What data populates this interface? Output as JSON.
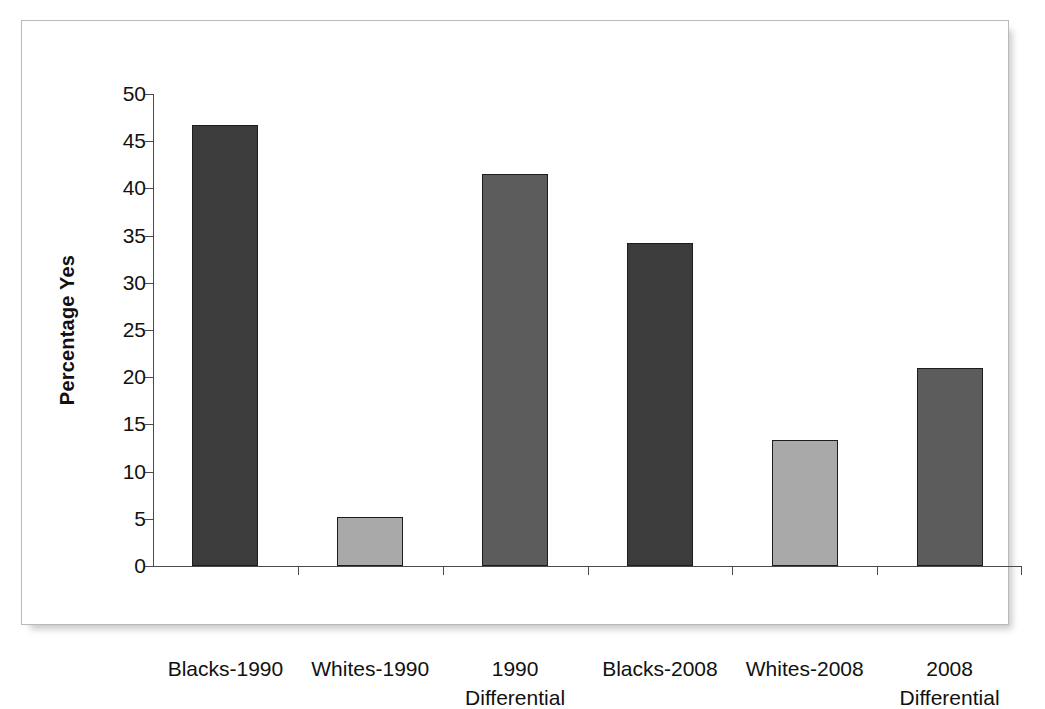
{
  "figure": {
    "background_color": "#ffffff",
    "frame_border_color": "#b9b9b9"
  },
  "chart_data": {
    "type": "bar",
    "title": "",
    "subtitle": "",
    "xlabel": "",
    "ylabel": "Percentage Yes",
    "ylim": [
      0,
      50
    ],
    "ytick_labels": [
      "0",
      "5",
      "10",
      "15",
      "20",
      "25",
      "30",
      "35",
      "40",
      "45",
      "50"
    ],
    "ytick_values": [
      0,
      5,
      10,
      15,
      20,
      25,
      30,
      35,
      40,
      45,
      50
    ],
    "grid": false,
    "legend": false,
    "legend_position": "none",
    "categories": [
      "Blacks-1990",
      "Whites-1990",
      "1990\nDifferential",
      "Blacks-2008",
      "Whites-2008",
      "2008\nDifferential"
    ],
    "values": [
      46.7,
      5.2,
      41.5,
      34.2,
      13.3,
      21.0
    ],
    "bar_colors": [
      "#3c3c3c",
      "#a9a9a9",
      "#5c5c5c",
      "#3c3c3c",
      "#a9a9a9",
      "#5c5c5c"
    ],
    "bar_edge_color": "#1d1d1d",
    "bars": [
      {
        "label": "Blacks-1990",
        "value": 46.7,
        "color": "#3c3c3c"
      },
      {
        "label": "Whites-1990",
        "value": 5.2,
        "color": "#a9a9a9"
      },
      {
        "label": "1990\nDifferential",
        "value": 41.5,
        "color": "#5c5c5c"
      },
      {
        "label": "Blacks-2008",
        "value": 34.2,
        "color": "#3c3c3c"
      },
      {
        "label": "Whites-2008",
        "value": 13.3,
        "color": "#a9a9a9"
      },
      {
        "label": "2008\nDifferential",
        "value": 21.0,
        "color": "#5c5c5c"
      }
    ]
  }
}
